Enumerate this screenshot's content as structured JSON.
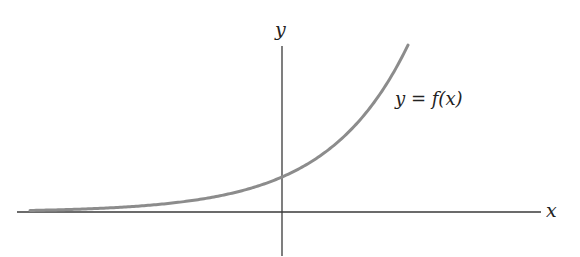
{
  "diagram": {
    "axes": {
      "x_label": "x",
      "y_label": "y"
    },
    "curve_label": "y = f(x)",
    "curve": {
      "type": "exponential",
      "y_intercept_px": 35,
      "growth_rate": 0.0124
    },
    "colors": {
      "axis": "#3a3a3a",
      "curve": "#8c8c8c",
      "text": "#222222"
    }
  }
}
